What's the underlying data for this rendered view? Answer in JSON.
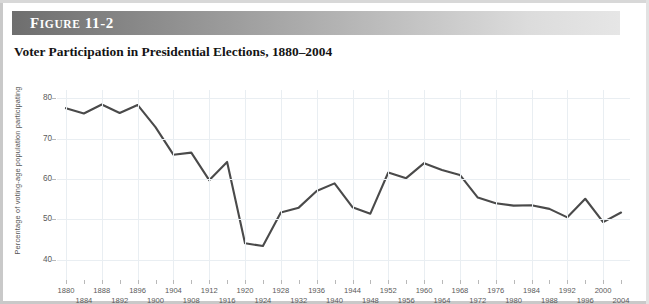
{
  "figure": {
    "banner_prefix": "F",
    "banner_word": "IGURE",
    "banner_number": "11-2",
    "banner_label": "FIGURE 11-2",
    "title": "Voter Participation in Presidential Elections, 1880–2004"
  },
  "colors": {
    "line": "#4a4a4a",
    "grid": "#e9eef2",
    "tick_text": "#5a5a5a",
    "banner_dark": "#6e6e6e",
    "banner_light": "#e6e6e6",
    "card_border": "#c9c9c9"
  },
  "chart_data": {
    "type": "line",
    "title": "Voter Participation in Presidential Elections, 1880–2004",
    "xlabel": "",
    "ylabel": "Percentage of voting-age population participating",
    "ylim": [
      35,
      82
    ],
    "xlim": [
      1878,
      2006
    ],
    "yticks": [
      40,
      50,
      60,
      70,
      80
    ],
    "grid": true,
    "legend": null,
    "x": [
      1880,
      1884,
      1888,
      1892,
      1896,
      1900,
      1904,
      1908,
      1912,
      1916,
      1920,
      1924,
      1928,
      1932,
      1936,
      1940,
      1944,
      1948,
      1952,
      1956,
      1960,
      1964,
      1968,
      1972,
      1976,
      1980,
      1984,
      1988,
      1992,
      1996,
      2000,
      2004
    ],
    "values": [
      77.5,
      76.2,
      78.4,
      76.3,
      78.3,
      72.8,
      66.0,
      66.5,
      59.7,
      64.2,
      44.1,
      43.4,
      51.7,
      52.9,
      57.0,
      58.9,
      53.0,
      51.4,
      61.6,
      60.2,
      63.9,
      62.2,
      61.0,
      55.4,
      54.0,
      53.4,
      53.5,
      52.6,
      50.5,
      55.1,
      49.3,
      51.7
    ],
    "series": [
      {
        "name": "Voter turnout",
        "values": [
          77.5,
          76.2,
          78.4,
          76.3,
          78.3,
          72.8,
          66.0,
          66.5,
          59.7,
          64.2,
          44.1,
          43.4,
          51.7,
          52.9,
          57.0,
          58.9,
          53.0,
          51.4,
          61.6,
          60.2,
          63.9,
          62.2,
          61.0,
          55.4,
          54.0,
          53.4,
          53.5,
          52.6,
          50.5,
          55.1,
          49.3,
          51.7
        ]
      }
    ],
    "x_labels_top": [
      "1880",
      "1888",
      "1896",
      "1904",
      "1912",
      "1920",
      "1928",
      "1936",
      "1944",
      "1952",
      "1960",
      "1968",
      "1976",
      "1984",
      "1992",
      "2000"
    ],
    "x_labels_bottom": [
      "1884",
      "1892",
      "1900",
      "1908",
      "1916",
      "1924",
      "1932",
      "1940",
      "1948",
      "1956",
      "1964",
      "1972",
      "1980",
      "1988",
      "1996",
      "2004"
    ]
  }
}
